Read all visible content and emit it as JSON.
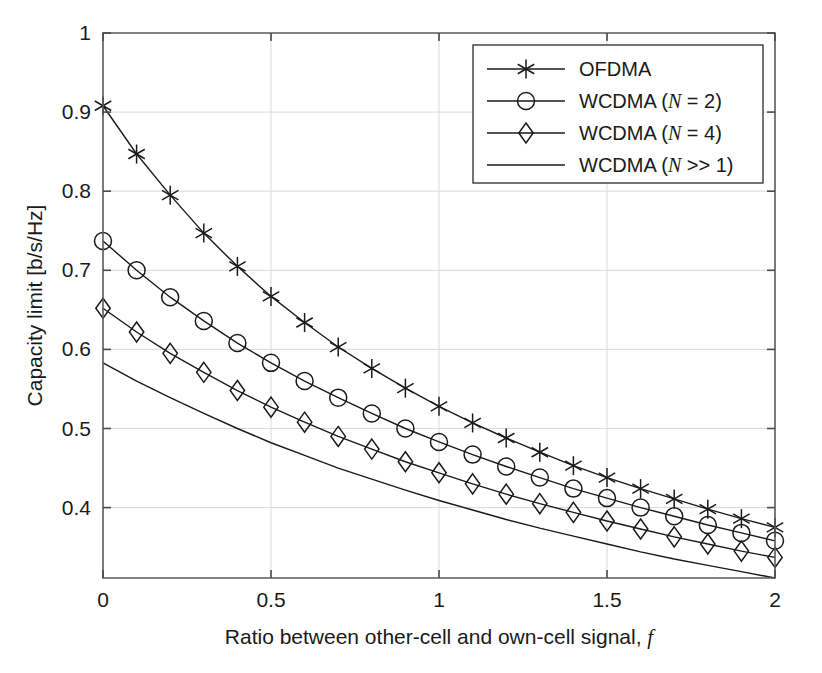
{
  "chart_data": {
    "type": "line",
    "title": "",
    "xlabel": "Ratio between other-cell and own-cell signal, f",
    "xlabel_plain": "Ratio between other-cell and own-cell signal,",
    "xlabel_symbol": "f",
    "ylabel": "Capacity limit [b/s/Hz]",
    "xlim": [
      0,
      2
    ],
    "ylim": [
      0.311,
      1.0
    ],
    "xticks": [
      0,
      0.5,
      1,
      1.5,
      2
    ],
    "xtick_labels": [
      "0",
      "0.5",
      "1",
      "1.5",
      "2"
    ],
    "yticks": [
      0.4,
      0.5,
      0.6,
      0.7,
      0.8,
      0.9,
      1.0
    ],
    "ytick_labels": [
      "0.4",
      "0.5",
      "0.6",
      "0.7",
      "0.8",
      "0.9",
      "1"
    ],
    "grid": true,
    "legend_position": "upper right",
    "x": [
      0,
      0.1,
      0.2,
      0.3,
      0.4,
      0.5,
      0.6,
      0.7,
      0.8,
      0.9,
      1.0,
      1.1,
      1.2,
      1.3,
      1.4,
      1.5,
      1.6,
      1.7,
      1.8,
      1.9,
      2.0
    ],
    "series": [
      {
        "name": "OFDMA",
        "marker": "asterisk",
        "values": [
          0.908,
          0.847,
          0.795,
          0.747,
          0.705,
          0.667,
          0.634,
          0.603,
          0.576,
          0.551,
          0.528,
          0.507,
          0.488,
          0.47,
          0.453,
          0.438,
          0.424,
          0.411,
          0.398,
          0.386,
          0.375
        ]
      },
      {
        "name": "WCDMA (N = 2)",
        "name_plain": "WCDMA (",
        "name_symbol": "N",
        "name_tail": " = 2)",
        "marker": "circle",
        "values": [
          0.737,
          0.7,
          0.666,
          0.636,
          0.608,
          0.583,
          0.56,
          0.539,
          0.519,
          0.5,
          0.483,
          0.467,
          0.452,
          0.438,
          0.424,
          0.412,
          0.4,
          0.389,
          0.378,
          0.368,
          0.358
        ]
      },
      {
        "name": "WCDMA (N = 4)",
        "name_plain": "WCDMA (",
        "name_symbol": "N",
        "name_tail": " = 4)",
        "marker": "diamond",
        "values": [
          0.652,
          0.622,
          0.595,
          0.571,
          0.548,
          0.527,
          0.508,
          0.49,
          0.474,
          0.458,
          0.444,
          0.43,
          0.417,
          0.405,
          0.394,
          0.383,
          0.373,
          0.363,
          0.354,
          0.345,
          0.337
        ]
      },
      {
        "name": "WCDMA (N >> 1)",
        "name_plain": "WCDMA (",
        "name_symbol": "N",
        "name_tail": " >> 1)",
        "marker": "none",
        "values": [
          0.583,
          0.56,
          0.539,
          0.519,
          0.5,
          0.482,
          0.466,
          0.45,
          0.436,
          0.422,
          0.409,
          0.397,
          0.385,
          0.374,
          0.364,
          0.354,
          0.344,
          0.335,
          0.327,
          0.319,
          0.311
        ]
      }
    ],
    "colors": {
      "line": "#1a1a1a",
      "grid": "#d9d9d9",
      "axis": "#5a5a5a",
      "background": "#ffffff"
    }
  }
}
